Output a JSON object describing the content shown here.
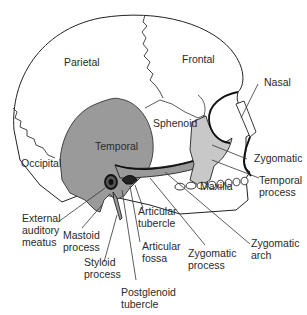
{
  "diagram": {
    "colors": {
      "background": "#ffffff",
      "outline": "#222222",
      "temporal_fill": "#9a9a9a",
      "zygomatic_fill": "#c8c8c8",
      "label_text": "#2a2a2a"
    },
    "bone_labels": {
      "parietal": "Parietal",
      "frontal": "Frontal",
      "temporal": "Temporal",
      "sphenoid": "Sphenoid",
      "occipital": "Occipital",
      "maxilla": "Maxilla"
    },
    "callouts": {
      "nasal": [
        "Nasal"
      ],
      "zygomatic": [
        "Zygomatic"
      ],
      "temporal_process": [
        "Temporal",
        "process"
      ],
      "external_auditory_meatus": [
        "External",
        "auditory",
        "meatus"
      ],
      "mastoid_process": [
        "Mastoid",
        "process"
      ],
      "styloid_process": [
        "Styloid",
        "process"
      ],
      "postglenoid_tubercle": [
        "Postglenoid",
        "tubercle"
      ],
      "articular_tubercle": [
        "Articular",
        "tubercle"
      ],
      "articular_fossa": [
        "Articular",
        "fossa"
      ],
      "zygomatic_process": [
        "Zygomatic",
        "process"
      ],
      "zygomatic_arch": [
        "Zygomatic",
        "arch"
      ]
    }
  }
}
